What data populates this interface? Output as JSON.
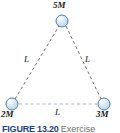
{
  "figure": {
    "kind": "physics-diagram",
    "colors": {
      "sphere_fill": "#cfe2f2",
      "sphere_highlight": "#ffffff",
      "sphere_outline": "#4e7fa8",
      "leg_line": "#6f6f6f",
      "base_line": "#aab8c4",
      "label_text": "#1a1a1a",
      "caption_number": "#1d3f86",
      "caption_text": "#6d6d6d"
    },
    "masses": [
      {
        "id": "top",
        "label": "5M",
        "x": 62,
        "y": 21,
        "radius": 6
      },
      {
        "id": "bottom-left",
        "label": "2M",
        "x": 12,
        "y": 104,
        "radius": 6
      },
      {
        "id": "bottom-right",
        "label": "3M",
        "x": 104,
        "y": 104,
        "radius": 6
      }
    ],
    "sides": [
      {
        "id": "left",
        "label": "L",
        "from": "bottom-left",
        "to": "top",
        "style": "dashed",
        "color": "#6f6f6f"
      },
      {
        "id": "right",
        "label": "L",
        "from": "top",
        "to": "bottom-right",
        "style": "dashed",
        "color": "#6f6f6f"
      },
      {
        "id": "bottom",
        "label": "L",
        "from": "bottom-left",
        "to": "bottom-right",
        "style": "dashed",
        "color": "#aab8c4"
      }
    ]
  },
  "caption": {
    "figure_number": "FIGURE 13.20",
    "text": "Exercise"
  }
}
